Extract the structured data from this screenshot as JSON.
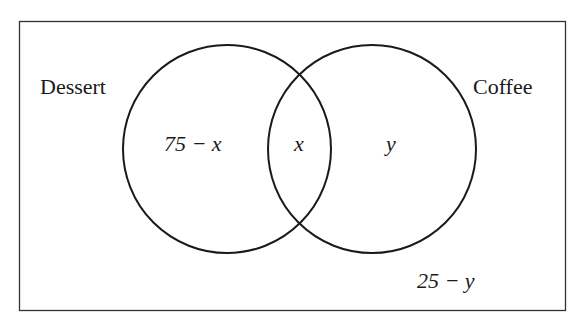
{
  "diagram": {
    "type": "venn",
    "sets": [
      {
        "name": "Dessert",
        "label": "Dessert",
        "only_region": "75 − x"
      },
      {
        "name": "Coffee",
        "label": "Coffee",
        "only_region": "y"
      }
    ],
    "intersection": "x",
    "outside": "25 − y",
    "colors": {
      "stroke": "#1a1a1a",
      "background": "#ffffff"
    }
  }
}
